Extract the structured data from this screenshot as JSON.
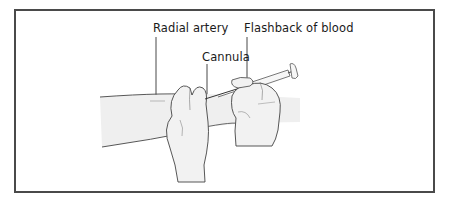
{
  "figure": {
    "labels": {
      "radial_artery": "Radial artery",
      "flashback": "Flashback of blood",
      "cannula": "Cannula"
    }
  }
}
